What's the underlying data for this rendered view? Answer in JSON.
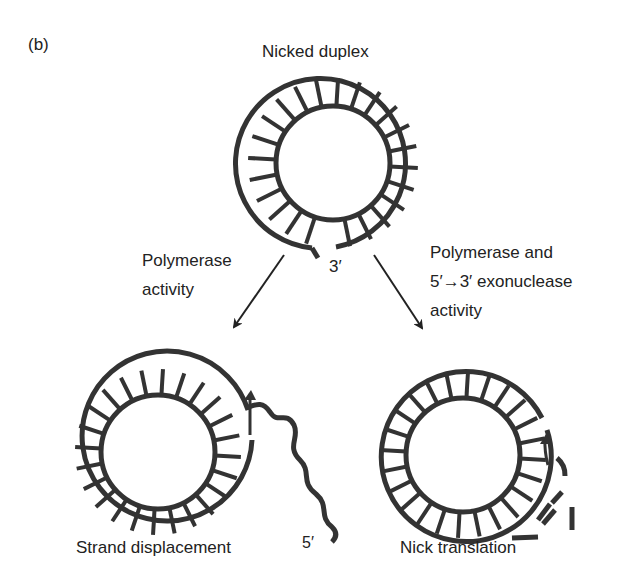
{
  "panel_label": "(b)",
  "top": {
    "title": "Nicked duplex",
    "end_label": "3′"
  },
  "left_arrow": {
    "line1": "Polymerase",
    "line2": "activity"
  },
  "right_arrow": {
    "line1": "Polymerase and",
    "line2": "5′→3′ exonuclease",
    "line3": "activity"
  },
  "bottom_left": {
    "caption": "Strand displacement",
    "end_label": "5′"
  },
  "bottom_right": {
    "caption": "Nick translation"
  },
  "colors": {
    "ink": "#333333",
    "text": "#222222"
  }
}
